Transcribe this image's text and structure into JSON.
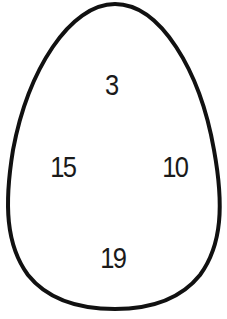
{
  "shape": {
    "type": "egg",
    "stroke_color": "#111111",
    "fill_color": "#ffffff"
  },
  "numbers": {
    "top": "3",
    "left": "15",
    "right": "10",
    "bottom": "19"
  }
}
